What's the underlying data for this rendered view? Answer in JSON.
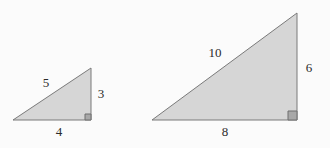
{
  "figure": {
    "background_color": "#fbfbfb",
    "fill_color": "#d6d6d6",
    "stroke_color": "#7a7a7a",
    "label_color": "#2b2b2b",
    "right_angle_marker_fill": "#a8a8a8",
    "right_angle_marker_stroke": "#6e6e6e"
  },
  "shapes": {
    "small_triangle": {
      "name": "small-right-triangle",
      "points": "13,120 91,120 91,68",
      "right_angle": {
        "marker_points": "85,114 91,114 91,120 85,120",
        "vertex": "bottom-right"
      },
      "labels": {
        "hypotenuse": {
          "text": "5",
          "x": 46,
          "y": 84
        },
        "vertical_leg": {
          "text": "3",
          "x": 101,
          "y": 95
        },
        "horizontal_leg": {
          "text": "4",
          "x": 59,
          "y": 133
        }
      }
    },
    "large_triangle": {
      "name": "large-right-triangle",
      "points": "152,120 297,120 297,13",
      "right_angle": {
        "marker_points": "288,111 297,111 297,120 288,120",
        "vertex": "bottom-right"
      },
      "labels": {
        "hypotenuse": {
          "text": "10",
          "x": 215,
          "y": 54
        },
        "vertical_leg": {
          "text": "6",
          "x": 309,
          "y": 69
        },
        "horizontal_leg": {
          "text": "8",
          "x": 225,
          "y": 133
        }
      }
    }
  }
}
